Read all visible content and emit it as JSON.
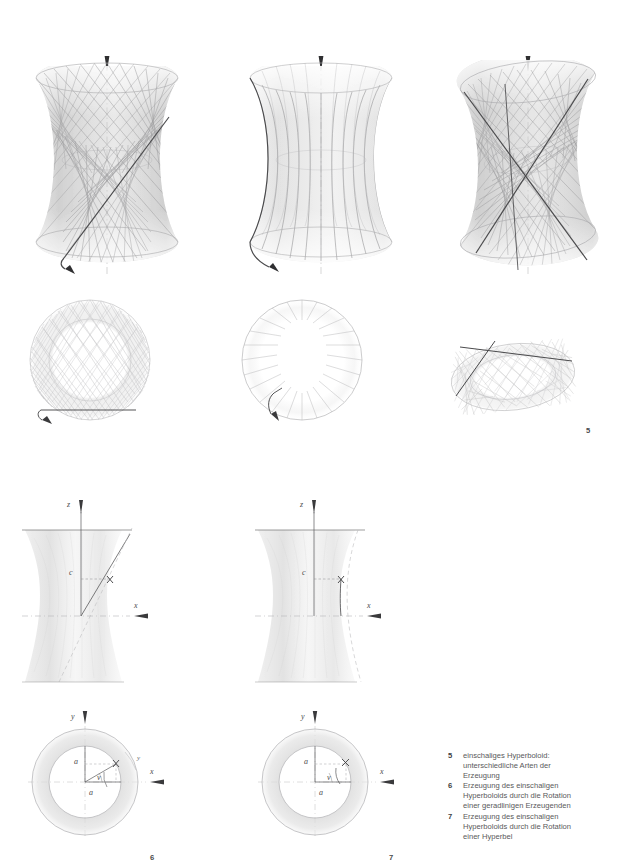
{
  "page": {
    "width": 641,
    "height": 867,
    "background": "#ffffff",
    "ink": "#4a4a4c"
  },
  "figure_numbers": {
    "top": "5",
    "bottom_left": "6",
    "bottom_right": "7"
  },
  "captions": [
    {
      "number": "5",
      "text": "einschaliges Hyperboloid:\nunterschiedliche Arten der\nErzeugung"
    },
    {
      "number": "6",
      "text": "Erzeugung des einschaligen\nHyperboloids durch die Rotation\neiner geradlinigen Erzeugenden"
    },
    {
      "number": "7",
      "text": "Erzeugung des einschaligen\nHyperboloids durch die Rotation\neiner Hyperbel"
    }
  ],
  "axis_labels": {
    "z": "z",
    "x": "x",
    "y": "y",
    "c": "c",
    "a": "a",
    "v": "v",
    "gamma": "y",
    "point": "X"
  },
  "diagrams": {
    "row1": [
      {
        "name": "hyperboloid-ruled-lattice",
        "kind": "3d-hyperboloid",
        "generators": "two-families-crossing",
        "highlight": "single-straight-generator"
      },
      {
        "name": "hyperboloid-meridian-hyperbolas",
        "kind": "3d-hyperboloid",
        "generators": "meridian-hyperbolas",
        "highlight": "single-hyperbola"
      },
      {
        "name": "hyperboloid-two-generators",
        "kind": "3d-hyperboloid",
        "generators": "two-families-crossing",
        "highlight": "two-crossing-straight-generators"
      }
    ],
    "row2": [
      {
        "name": "plan-view-ruled-lattice",
        "kind": "plan-circle",
        "chords": 36,
        "highlight": "single-chord"
      },
      {
        "name": "plan-view-meridians",
        "kind": "plan-circle",
        "chords": 0,
        "radials": 24,
        "highlight": "single-radial"
      },
      {
        "name": "plan-view-tilted-ellipse",
        "kind": "plan-ellipse",
        "chords": 36,
        "highlight": "two-crossing-chords"
      }
    ],
    "row3": [
      {
        "name": "elevation-straight-generatrix",
        "kind": "elevation",
        "curve": "straight-line",
        "labels": [
          "z",
          "x",
          "c",
          "X"
        ]
      },
      {
        "name": "elevation-hyperbola-generatrix",
        "kind": "elevation",
        "curve": "hyperbola",
        "labels": [
          "z",
          "x",
          "c",
          "X"
        ]
      }
    ],
    "row4": [
      {
        "name": "plan-straight-generatrix",
        "kind": "plan-annulus",
        "labels": [
          "y",
          "x",
          "a",
          "a",
          "v",
          "y",
          "X"
        ]
      },
      {
        "name": "plan-hyperbola-generatrix",
        "kind": "plan-annulus",
        "labels": [
          "y",
          "x",
          "a",
          "a",
          "v",
          "X"
        ]
      }
    ]
  }
}
